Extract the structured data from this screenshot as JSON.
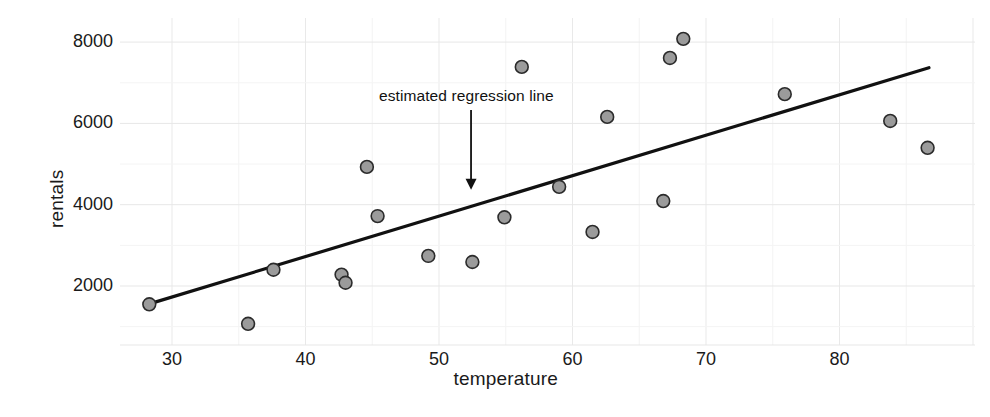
{
  "chart_data": {
    "type": "scatter",
    "title": "",
    "xlabel": "temperature",
    "ylabel": "rentals",
    "xlim": [
      24.5,
      88.5
    ],
    "ylim": [
      700,
      8500
    ],
    "xticks": [
      30,
      40,
      50,
      60,
      70,
      80
    ],
    "yticks": [
      2000,
      4000,
      6000,
      8000
    ],
    "minor_gridlines": true,
    "grid": true,
    "legend": "none",
    "marker": {
      "shape": "circle",
      "fill_color": "#9b9b9b",
      "edge_color": "#2b2b2b",
      "size_px": 15
    },
    "points": [
      {
        "x": 28.3,
        "y": 1550
      },
      {
        "x": 35.7,
        "y": 1070
      },
      {
        "x": 37.6,
        "y": 2400
      },
      {
        "x": 42.7,
        "y": 2280
      },
      {
        "x": 43.0,
        "y": 2080
      },
      {
        "x": 44.6,
        "y": 4930
      },
      {
        "x": 45.4,
        "y": 3720
      },
      {
        "x": 49.2,
        "y": 2740
      },
      {
        "x": 52.5,
        "y": 2590
      },
      {
        "x": 54.9,
        "y": 3690
      },
      {
        "x": 56.2,
        "y": 7390
      },
      {
        "x": 59.0,
        "y": 4440
      },
      {
        "x": 61.5,
        "y": 3330
      },
      {
        "x": 62.6,
        "y": 6160
      },
      {
        "x": 66.8,
        "y": 4090
      },
      {
        "x": 67.3,
        "y": 7610
      },
      {
        "x": 68.3,
        "y": 8080
      },
      {
        "x": 75.9,
        "y": 6720
      },
      {
        "x": 83.8,
        "y": 6060
      },
      {
        "x": 86.6,
        "y": 5400
      }
    ],
    "regression_line": {
      "color": "#111111",
      "width_px": 3.2,
      "x_start": 28.3,
      "y_start": 1560,
      "x_end": 86.7,
      "y_end": 7370
    },
    "annotation": {
      "text": "estimated regression line",
      "text_x": 45.5,
      "text_y": 6650,
      "arrow_x": 52.4,
      "arrow_y_tail": 6330,
      "arrow_y_head": 4370,
      "color": "#111111"
    },
    "grid_color": "#eeeeee",
    "background": "#ffffff"
  }
}
